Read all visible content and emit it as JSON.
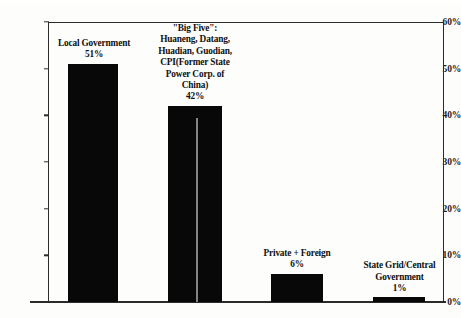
{
  "chart_data": {
    "type": "bar",
    "title": "",
    "xlabel": "",
    "ylabel": "",
    "ylim": [
      0,
      60
    ],
    "grid": false,
    "legend": null,
    "categories": [
      "Local Government",
      "\"Big Five\": Huaneng, Datang, Huadian, Guodian, CPI(Former State Power Corp. of China)",
      "Private + Foreign",
      "State Grid/Central Government"
    ],
    "values": [
      51,
      42,
      6,
      1
    ],
    "value_labels": [
      "51%",
      "42%",
      "6%",
      "1%"
    ],
    "y_ticks": [
      0,
      10,
      20,
      30,
      40,
      50,
      60
    ],
    "y_tick_labels": [
      "0%",
      "10%",
      "20%",
      "30%",
      "40%",
      "50%",
      "60%"
    ]
  },
  "bars": [
    {
      "name": "local-government",
      "label_lines": [
        "Local Government"
      ],
      "value_label": "51%",
      "value": 51
    },
    {
      "name": "big-five",
      "label_lines": [
        "\"Big Five\":",
        "Huaneng, Datang,",
        "Huadian, Guodian,",
        "CPI(Former State",
        "Power Corp. of",
        "China)"
      ],
      "value_label": "42%",
      "value": 42
    },
    {
      "name": "private-foreign",
      "label_lines": [
        "Private + Foreign"
      ],
      "value_label": "6%",
      "value": 6
    },
    {
      "name": "state-grid-central-government",
      "label_lines": [
        "State Grid/Central",
        "Government"
      ],
      "value_label": "1%",
      "value": 1
    }
  ],
  "colors": {
    "bar": "#080808",
    "axis": "#2b2b2b",
    "text": "#101010",
    "background": "#fdfdfc"
  }
}
